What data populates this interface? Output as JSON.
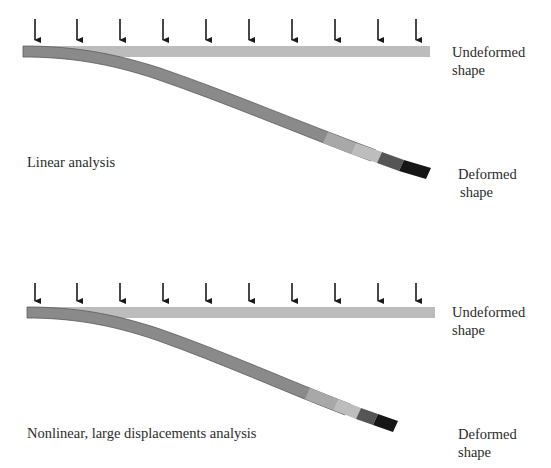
{
  "panels": [
    {
      "id": "linear",
      "caption": "Linear analysis",
      "undeformed_label": [
        "Undeformed",
        "shape"
      ],
      "deformed_label": [
        "Deformed",
        "shape"
      ],
      "load_arrow_count": 10
    },
    {
      "id": "nonlinear",
      "caption": "Nonlinear, large displacements analysis",
      "undeformed_label": [
        "Undeformed",
        "shape"
      ],
      "deformed_label": [
        "Deformed",
        "shape"
      ],
      "load_arrow_count": 10
    }
  ],
  "colors": {
    "undeformed_bar": "#bcbcbc",
    "deformed_bar": "#8a8a8a",
    "deformed_edge": "#5a5a5a",
    "band_light": "#b4b4b4",
    "band_dark": "#555555",
    "band_black": "#161616",
    "arrow": "#1a1a1a"
  }
}
